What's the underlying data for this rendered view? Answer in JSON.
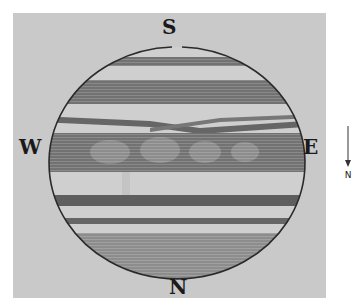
{
  "figure": {
    "caption_fragment": "",
    "compass": {
      "top": "S",
      "left": "W",
      "right": "E",
      "bottom": "N"
    },
    "orientation_arrow": {
      "direction": "down",
      "label": "N"
    },
    "colors": {
      "page_background": "#ffffff",
      "plate_background": "#c9c9c9",
      "disk_fill": "#cfcfcf",
      "band_dark": "#5e5e5e",
      "band_mid": "#7a7a7a",
      "outline": "#2a2a2a"
    },
    "bands": [
      {
        "name": "south-polar-thin-band",
        "y_top": 57,
        "y_bottom": 66
      },
      {
        "name": "south-temperate-wide-band",
        "y_top": 80,
        "y_bottom": 104
      },
      {
        "name": "slanted-streak",
        "y_top": 118,
        "y_bottom": 128
      },
      {
        "name": "equatorial-band",
        "y_top": 133,
        "y_bottom": 172
      },
      {
        "name": "north-equatorial-band",
        "y_top": 195,
        "y_bottom": 206
      },
      {
        "name": "north-temperate-thin-band",
        "y_top": 218,
        "y_bottom": 224
      },
      {
        "name": "north-polar-hatched-region",
        "y_top": 233,
        "y_bottom": 268
      }
    ]
  }
}
